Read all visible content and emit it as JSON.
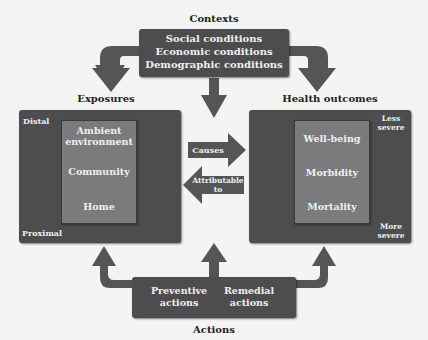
{
  "contexts": {
    "title": "Contexts",
    "items": [
      "Social conditions",
      "Economic conditions",
      "Demographic conditions"
    ]
  },
  "exposures": {
    "title": "Exposures",
    "scale_top": "Distal",
    "scale_bottom": "Proximal",
    "items": [
      "Ambient environment",
      "Community",
      "Home"
    ]
  },
  "health_outcomes": {
    "title": "Health outcomes",
    "scale_top": "Less severe",
    "scale_bottom": "More severe",
    "items": [
      "Well-being",
      "Morbidity",
      "Mortality"
    ]
  },
  "links": {
    "causes": "Causes",
    "attributable": "Attributable to"
  },
  "actions": {
    "title": "Actions",
    "items": [
      "Preventive actions",
      "Remedial actions"
    ]
  },
  "colors": {
    "dark_box": "#4d4d4f",
    "inner_box": "#7b7b7d",
    "arrow": "#555557",
    "background": "#f4f4f2"
  }
}
